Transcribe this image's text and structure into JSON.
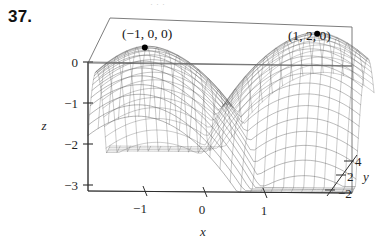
{
  "figure": {
    "exercise_number": "37.",
    "top_bleed_text": "· · ·"
  },
  "annotations": [
    {
      "name": "left-peak-label",
      "text": "(−1, 0, 0)",
      "x": 122,
      "y": 38
    },
    {
      "name": "right-peak-label",
      "text": "(1, 2, 0)",
      "x": 288,
      "y": 40
    }
  ],
  "chart_data": {
    "type": "surface",
    "title": "",
    "subtitle": "",
    "xlabel": "x",
    "ylabel": "y",
    "zlabel": "z",
    "grid": false,
    "legend_position": "none",
    "projection": "3d-wireframe-box",
    "xlim": [
      -1.6,
      1.6
    ],
    "ylim": [
      -2,
      4
    ],
    "zlim": [
      -3,
      0
    ],
    "xticks": [
      -1,
      0,
      1
    ],
    "xtick_labels": [
      "−1",
      "0",
      "1"
    ],
    "yticks": [
      -2,
      2,
      4
    ],
    "ytick_labels": [
      "−2",
      "2",
      "4"
    ],
    "zticks": [
      0,
      -1,
      -2,
      -3
    ],
    "ztick_labels": [
      "0",
      "−1",
      "−2",
      "−3"
    ],
    "marked_points": [
      {
        "label": "(−1, 0, 0)",
        "x": -1,
        "y": 0,
        "z": 0
      },
      {
        "label": "(1, 2, 0)",
        "x": 1,
        "y": 2,
        "z": 0
      }
    ],
    "surface_formula": "z = -((x+1)^2 + (y-0)^2)^0.9 min -((x-1)^2 + (y-2)^2)^0.9 clipped at -3",
    "mesh_u_lines": 28,
    "mesh_v_lines": 26,
    "colors": {
      "mesh": "#5a5a5a",
      "box": "#6b6b6b",
      "axis": "#2b2b2b",
      "marker": "#000000",
      "background": "#ffffff"
    }
  }
}
